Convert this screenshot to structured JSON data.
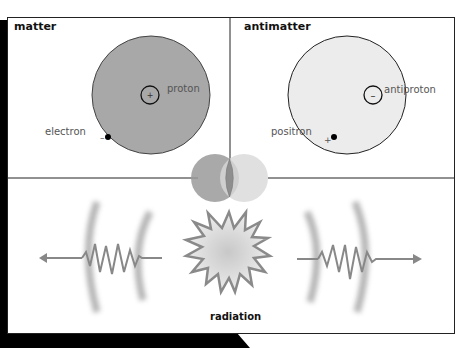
{
  "panels": {
    "matter": {
      "title": "matter",
      "nucleus_label": "proton",
      "nucleus_charge": "+",
      "particle_label": "electron",
      "particle_charge": "–",
      "fill_color": "#a8a8a8"
    },
    "antimatter": {
      "title": "antimatter",
      "nucleus_label": "antiproton",
      "nucleus_charge": "–",
      "particle_label": "positron",
      "particle_charge": "+",
      "fill_color": "#ececec"
    }
  },
  "annihilation": {
    "caption": "radiation",
    "left_circle_color": "#9a9a9a",
    "right_circle_color": "#d8d8d8"
  },
  "colors": {
    "line": "#222222",
    "wave": "#8a8a8a",
    "shadow": "#000000"
  }
}
